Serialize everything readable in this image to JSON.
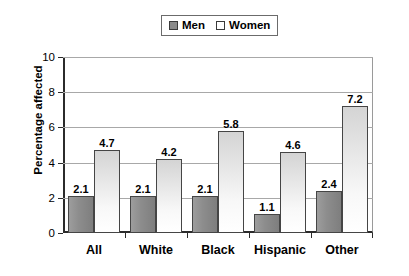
{
  "chart_data": {
    "type": "bar",
    "title": "",
    "subtitle": "",
    "xlabel": "",
    "ylabel": "Percentage affected",
    "categories": [
      "All",
      "White",
      "Black",
      "Hispanic",
      "Other"
    ],
    "series": [
      {
        "name": "Men",
        "values": [
          2.1,
          2.1,
          2.1,
          1.1,
          2.4
        ],
        "labels": [
          "2.1",
          "2.1",
          "2.1",
          "1.1",
          "2.4"
        ],
        "color": "#8a8a8a",
        "swatch": "men-swatch-icon"
      },
      {
        "name": "Women",
        "values": [
          4.7,
          4.2,
          5.8,
          4.6,
          7.2
        ],
        "labels": [
          "4.7",
          "4.2",
          "5.8",
          "4.6",
          "7.2"
        ],
        "color": "#ffffff",
        "swatch": "women-swatch-icon"
      }
    ],
    "ylim": [
      0,
      10
    ],
    "yticks": [
      0,
      2,
      4,
      6,
      8,
      10
    ],
    "ytick_labels": [
      "0",
      "2",
      "4",
      "6",
      "8",
      "10"
    ],
    "grid": true,
    "grid_axis": "y",
    "legend_position": "top-center",
    "legend_entries": [
      "Men",
      "Women"
    ],
    "background_color": "#ffffff",
    "axis_color": "#2b2b2b",
    "gridline_color": "#a8a8a8"
  },
  "legend": {
    "men_label": "Men",
    "women_label": "Women"
  },
  "axes": {
    "y_title": "Percentage affected",
    "y_tick_0": "0",
    "y_tick_1": "2",
    "y_tick_2": "4",
    "y_tick_3": "6",
    "y_tick_4": "8",
    "y_tick_5": "10"
  },
  "x_categories": {
    "c0": "All",
    "c1": "White",
    "c2": "Black",
    "c3": "Hispanic",
    "c4": "Other"
  }
}
